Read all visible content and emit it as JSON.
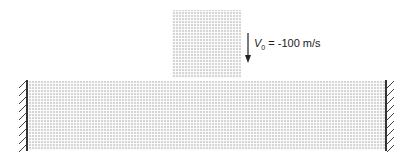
{
  "figure": {
    "projectile": {
      "label": "projectile-mesh"
    },
    "target": {
      "label": "target-mesh"
    },
    "velocity_label": {
      "symbol": "V",
      "subscript": "0",
      "value_text": " = -100 m/s"
    },
    "boundary": {
      "left": "fixed",
      "right": "fixed"
    },
    "colors": {
      "mesh": "#d6d6d6",
      "wall": "#333333"
    }
  }
}
